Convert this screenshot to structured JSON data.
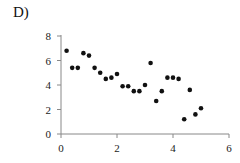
{
  "panel_label": "D)",
  "chart_data": {
    "type": "scatter",
    "title": "",
    "xlabel": "",
    "ylabel": "",
    "xlim": [
      0,
      6
    ],
    "ylim": [
      0,
      8
    ],
    "xticks": [
      0,
      2,
      4,
      6
    ],
    "yticks": [
      0,
      2,
      4,
      6,
      8
    ],
    "grid": false,
    "legend": null,
    "marker_color": "#111111",
    "axis_color": "#888888",
    "points": [
      {
        "x": 0.2,
        "y": 6.8
      },
      {
        "x": 0.4,
        "y": 5.4
      },
      {
        "x": 0.6,
        "y": 5.4
      },
      {
        "x": 0.8,
        "y": 6.6
      },
      {
        "x": 1.0,
        "y": 6.4
      },
      {
        "x": 1.2,
        "y": 5.4
      },
      {
        "x": 1.4,
        "y": 5.0
      },
      {
        "x": 1.6,
        "y": 4.5
      },
      {
        "x": 1.8,
        "y": 4.6
      },
      {
        "x": 2.0,
        "y": 4.9
      },
      {
        "x": 2.2,
        "y": 3.9
      },
      {
        "x": 2.4,
        "y": 3.9
      },
      {
        "x": 2.6,
        "y": 3.5
      },
      {
        "x": 2.8,
        "y": 3.5
      },
      {
        "x": 3.0,
        "y": 4.0
      },
      {
        "x": 3.2,
        "y": 5.8
      },
      {
        "x": 3.4,
        "y": 2.7
      },
      {
        "x": 3.6,
        "y": 3.5
      },
      {
        "x": 3.8,
        "y": 4.6
      },
      {
        "x": 4.0,
        "y": 4.6
      },
      {
        "x": 4.2,
        "y": 4.5
      },
      {
        "x": 4.4,
        "y": 1.2
      },
      {
        "x": 4.6,
        "y": 3.6
      },
      {
        "x": 4.8,
        "y": 1.6
      },
      {
        "x": 5.0,
        "y": 2.1
      }
    ]
  }
}
